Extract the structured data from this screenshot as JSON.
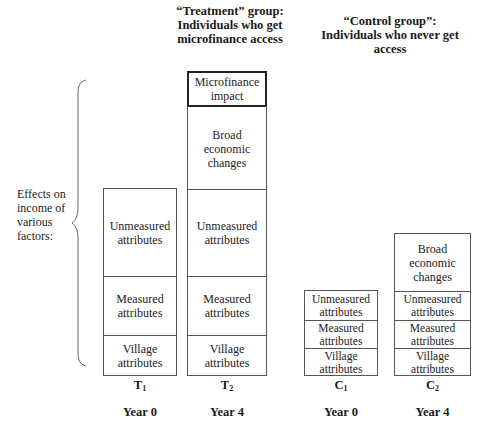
{
  "headings": {
    "treatment": "“Treatment” group: Individuals who get microfinance access",
    "treatment_lines": [
      "“Treatment” group:",
      "Individuals who get",
      "microfinance access"
    ],
    "control_lines": [
      "“Control group”:",
      "Individuals who never get",
      "access"
    ]
  },
  "side_label_lines": [
    "Effects on",
    "income of",
    "various",
    "factors:"
  ],
  "columns": [
    {
      "id": "T1",
      "letter": "T",
      "sub": "1",
      "year": "Year 0",
      "segments": [
        {
          "label_lines": [
            "Unmeasured",
            "attributes"
          ]
        },
        {
          "label_lines": [
            "Measured",
            "attributes"
          ]
        },
        {
          "label_lines": [
            "Village",
            "attributes"
          ]
        }
      ]
    },
    {
      "id": "T2",
      "letter": "T",
      "sub": "2",
      "year": "Year 4",
      "segments": [
        {
          "label_lines": [
            "Microfinance",
            "impact"
          ],
          "emphasis": true
        },
        {
          "label_lines": [
            "Broad",
            "economic",
            "changes"
          ]
        },
        {
          "label_lines": [
            "Unmeasured",
            "attributes"
          ]
        },
        {
          "label_lines": [
            "Measured",
            "attributes"
          ]
        },
        {
          "label_lines": [
            "Village",
            "attributes"
          ]
        }
      ]
    },
    {
      "id": "C1",
      "letter": "C",
      "sub": "1",
      "year": "Year 0",
      "segments": [
        {
          "label_lines": [
            "Unmeasured",
            "attributes"
          ]
        },
        {
          "label_lines": [
            "Measured",
            "attributes"
          ]
        },
        {
          "label_lines": [
            "Village",
            "attributes"
          ]
        }
      ]
    },
    {
      "id": "C2",
      "letter": "C",
      "sub": "2",
      "year": "Year 4",
      "segments": [
        {
          "label_lines": [
            "Broad",
            "economic",
            "changes"
          ]
        },
        {
          "label_lines": [
            "Unmeasured",
            "attributes"
          ]
        },
        {
          "label_lines": [
            "Measured",
            "attributes"
          ]
        },
        {
          "label_lines": [
            "Village",
            "attributes"
          ]
        }
      ]
    }
  ],
  "colors": {
    "border": "#555555",
    "emphasis_border": "#222222",
    "text": "#1a1a1a"
  }
}
